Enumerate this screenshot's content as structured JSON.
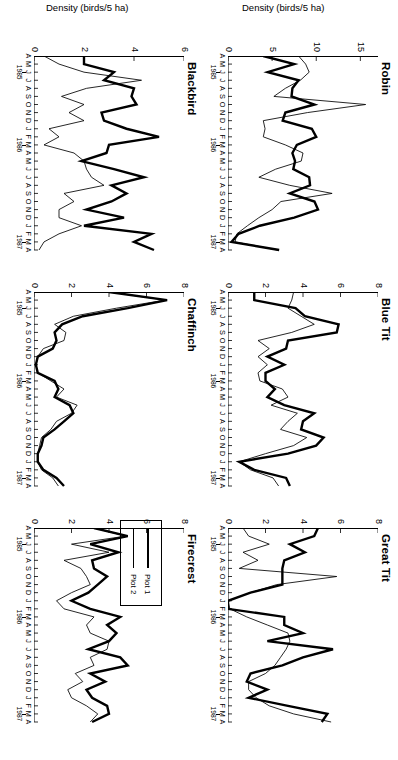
{
  "figure": {
    "y_axis_title": "Density  (birds/5 ha)",
    "legend": {
      "items": [
        {
          "label": "Plot 1",
          "style": "thick"
        },
        {
          "label": "Plot 2",
          "style": "thin"
        }
      ]
    },
    "month_ticks": [
      "A",
      "M",
      "J",
      "J",
      "A",
      "S",
      "O",
      "N",
      "D",
      "J",
      "F",
      "M",
      "A",
      "M",
      "J",
      "J",
      "A",
      "S",
      "O",
      "N",
      "D",
      "J",
      "F",
      "M",
      "A"
    ],
    "year_ticks": [
      {
        "label": "1985",
        "index": 2
      },
      {
        "label": "1986",
        "index": 11
      },
      {
        "label": "1987",
        "index": 23
      }
    ]
  },
  "chart_data": [
    {
      "type": "line",
      "title": "Robin",
      "xlabel": "",
      "ylabel": "Density (birds/5 ha)",
      "ylim": [
        0,
        17
      ],
      "yticks": [
        0,
        5,
        10,
        15
      ],
      "categories": [
        "A",
        "M",
        "J",
        "J",
        "A",
        "S",
        "O",
        "N",
        "D",
        "J",
        "F",
        "M",
        "A",
        "M",
        "J",
        "J",
        "A",
        "S",
        "O",
        "N",
        "D",
        "J",
        "F",
        "M",
        "A"
      ],
      "series": [
        {
          "name": "Plot 1",
          "style": "thick",
          "values": [
            4.0,
            7.5,
            4.5,
            8.0,
            7.3,
            7.2,
            9.8,
            6.5,
            6.2,
            9.5,
            10.0,
            7.8,
            7.3,
            7.6,
            7.4,
            9.2,
            9.3,
            7.0,
            9.8,
            10.2,
            7.5,
            3.6,
            1.2,
            0.4,
            5.8
          ]
        },
        {
          "name": "Plot 2",
          "style": "thin",
          "values": [
            8.0,
            8.8,
            9.2,
            8.2,
            6.5,
            5.2,
            15.6,
            9.0,
            4.0,
            4.2,
            4.0,
            6.5,
            8.5,
            8.3,
            5.4,
            3.5,
            7.0,
            11.8,
            6.0,
            5.0,
            3.5,
            2.2,
            1.0,
            0.8,
            5.6
          ]
        }
      ]
    },
    {
      "type": "line",
      "title": "Blue Tit",
      "xlabel": "",
      "ylabel": "Density (birds/5 ha)",
      "ylim": [
        0,
        8
      ],
      "yticks": [
        0,
        2,
        4,
        6,
        8
      ],
      "categories": [
        "A",
        "M",
        "J",
        "J",
        "A",
        "S",
        "O",
        "N",
        "D",
        "J",
        "F",
        "M",
        "A",
        "M",
        "J",
        "J",
        "A",
        "S",
        "O",
        "N",
        "D",
        "J",
        "F",
        "M",
        "A"
      ],
      "series": [
        {
          "name": "Plot 1",
          "style": "thick",
          "values": [
            1.4,
            1.4,
            3.6,
            4.1,
            5.9,
            5.8,
            3.2,
            3.1,
            2.1,
            3.0,
            2.0,
            2.0,
            2.5,
            2.1,
            3.0,
            4.6,
            4.0,
            3.9,
            5.1,
            4.7,
            3.2,
            0.6,
            1.4,
            3.1,
            3.3
          ]
        },
        {
          "name": "Plot 2",
          "style": "thin",
          "values": [
            3.5,
            3.4,
            3.2,
            3.9,
            4.6,
            3.4,
            1.6,
            2.2,
            1.6,
            2.1,
            1.6,
            1.7,
            2.9,
            3.2,
            2.3,
            3.7,
            3.2,
            2.8,
            4.2,
            3.5,
            2.0,
            0.6,
            1.2,
            2.4,
            2.7
          ]
        }
      ]
    },
    {
      "type": "line",
      "title": "Great Tit",
      "xlabel": "",
      "ylabel": "Density (birds/5 ha)",
      "ylim": [
        0,
        8
      ],
      "yticks": [
        0,
        2,
        4,
        6,
        8
      ],
      "categories": [
        "A",
        "M",
        "J",
        "J",
        "A",
        "S",
        "O",
        "N",
        "D",
        "J",
        "F",
        "M",
        "A",
        "M",
        "J",
        "J",
        "A",
        "S",
        "O",
        "N",
        "D",
        "J",
        "F",
        "M",
        "A"
      ],
      "series": [
        {
          "name": "Plot 1",
          "style": "thick",
          "values": [
            4.8,
            4.6,
            3.3,
            4.1,
            3.0,
            2.9,
            2.9,
            2.9,
            1.2,
            0.0,
            0.0,
            3.0,
            3.0,
            4.0,
            2.1,
            5.6,
            4.0,
            2.9,
            1.2,
            1.0,
            2.1,
            1.1,
            3.2,
            5.3,
            5.0
          ]
        },
        {
          "name": "Plot 2",
          "style": "thin",
          "values": [
            0.8,
            1.1,
            2.2,
            0.8,
            1.6,
            0.6,
            5.8,
            2.6,
            1.2,
            0.0,
            0.1,
            1.0,
            2.1,
            3.2,
            3.3,
            3.1,
            2.8,
            2.5,
            2.0,
            1.1,
            1.1,
            1.5,
            2.2,
            3.5,
            5.5
          ]
        }
      ]
    },
    {
      "type": "line",
      "title": "Blackbird",
      "xlabel": "",
      "ylabel": "Density (birds/5 ha)",
      "ylim": [
        0,
        6
      ],
      "yticks": [
        0,
        2,
        4,
        6
      ],
      "categories": [
        "A",
        "M",
        "J",
        "J",
        "A",
        "S",
        "O",
        "N",
        "D",
        "J",
        "F",
        "M",
        "A",
        "M",
        "J",
        "J",
        "A",
        "S",
        "O",
        "N",
        "D",
        "J",
        "F",
        "M",
        "A"
      ],
      "series": [
        {
          "name": "Plot 1",
          "style": "thick",
          "values": [
            2.0,
            2.0,
            3.2,
            2.8,
            4.0,
            3.9,
            4.1,
            2.7,
            2.8,
            3.7,
            5.0,
            3.0,
            2.9,
            1.9,
            3.2,
            4.4,
            3.1,
            3.7,
            3.1,
            2.1,
            3.6,
            2.0,
            4.7,
            4.0,
            4.8
          ]
        },
        {
          "name": "Plot 2",
          "style": "thin",
          "values": [
            0.4,
            1.0,
            2.0,
            4.3,
            2.1,
            1.1,
            2.0,
            1.4,
            2.0,
            0.6,
            1.0,
            0.4,
            1.6,
            2.0,
            2.1,
            2.3,
            2.8,
            1.2,
            1.6,
            1.0,
            1.0,
            1.9,
            1.0,
            0.4,
            0.2
          ]
        }
      ]
    },
    {
      "type": "line",
      "title": "Chaffinch",
      "xlabel": "",
      "ylabel": "Density (birds/5 ha)",
      "ylim": [
        0,
        8
      ],
      "yticks": [
        0,
        2,
        4,
        6,
        8
      ],
      "categories": [
        "A",
        "M",
        "J",
        "J",
        "A",
        "S",
        "O",
        "N",
        "D",
        "J",
        "F",
        "M",
        "A",
        "M",
        "J",
        "J",
        "A",
        "S",
        "O",
        "N",
        "D",
        "J",
        "F",
        "M",
        "A"
      ],
      "series": [
        {
          "name": "Plot 1",
          "style": "thick",
          "values": [
            4.0,
            7.1,
            5.0,
            2.6,
            1.5,
            1.1,
            1.2,
            1.0,
            0.2,
            0.1,
            0.2,
            1.1,
            1.3,
            1.1,
            1.9,
            2.1,
            1.6,
            1.1,
            0.5,
            0.4,
            0.2,
            0.2,
            0.5,
            1.2,
            1.6
          ]
        },
        {
          "name": "Plot 2",
          "style": "thin",
          "values": [
            4.0,
            7.0,
            4.4,
            2.1,
            1.1,
            1.7,
            1.6,
            0.5,
            0.2,
            0.1,
            0.2,
            0.9,
            1.6,
            1.2,
            2.3,
            2.0,
            1.2,
            0.9,
            0.4,
            0.3,
            0.2,
            0.2,
            0.4,
            1.0,
            1.3
          ]
        }
      ]
    },
    {
      "type": "line",
      "title": "Firecrest",
      "xlabel": "",
      "ylabel": "Density (birds/5 ha)",
      "ylim": [
        0,
        8
      ],
      "yticks": [
        0,
        2,
        4,
        6,
        8
      ],
      "categories": [
        "A",
        "M",
        "J",
        "J",
        "A",
        "S",
        "O",
        "N",
        "D",
        "J",
        "F",
        "M",
        "A",
        "M",
        "J",
        "J",
        "A",
        "S",
        "O",
        "N",
        "D",
        "J",
        "F",
        "M",
        "A"
      ],
      "series": [
        {
          "name": "Plot 1",
          "style": "thick",
          "values": [
            3.2,
            5.0,
            3.0,
            4.5,
            3.1,
            3.2,
            3.9,
            3.4,
            2.9,
            2.0,
            3.0,
            4.6,
            3.9,
            4.4,
            4.0,
            2.9,
            4.6,
            5.0,
            3.0,
            3.8,
            2.8,
            3.1,
            3.9,
            4.0,
            3.1
          ]
        },
        {
          "name": "Plot 2",
          "style": "thin",
          "values": [
            3.2,
            4.9,
            2.0,
            4.0,
            1.6,
            2.5,
            2.8,
            3.0,
            2.0,
            1.2,
            1.6,
            3.2,
            2.8,
            3.0,
            4.0,
            3.9,
            3.0,
            3.2,
            2.2,
            2.6,
            1.8,
            2.0,
            2.8,
            3.4,
            3.0
          ]
        }
      ]
    }
  ]
}
